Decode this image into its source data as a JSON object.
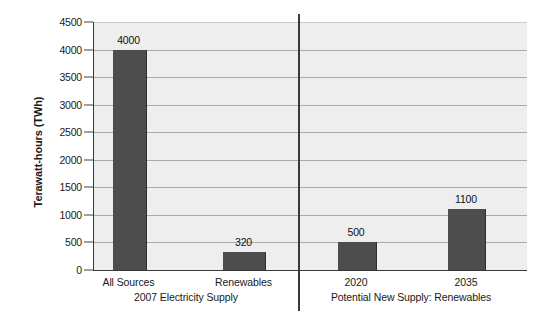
{
  "chart_data": {
    "type": "bar",
    "title": "",
    "xlabel": "",
    "ylabel": "Terawatt-hours (TWh)",
    "ylim": [
      0,
      4500
    ],
    "ytick_step": 500,
    "grid": true,
    "legend": "none",
    "categories": [
      "All Sources",
      "Renewables",
      "2020",
      "2035"
    ],
    "values": [
      4000,
      320,
      500,
      1100
    ],
    "value_labels": [
      "4000",
      "320",
      "500",
      "1100"
    ],
    "groups": [
      {
        "label": "2007 Electricity Supply",
        "categories": [
          "All Sources",
          "Renewables"
        ],
        "values": [
          4000,
          320
        ]
      },
      {
        "label": "Potential New Supply: Renewables",
        "categories": [
          "2020",
          "2035"
        ],
        "values": [
          500,
          1100
        ]
      }
    ],
    "yticks": [
      {
        "value": 4500,
        "label": "4500"
      },
      {
        "value": 4000,
        "label": "4000"
      },
      {
        "value": 3500,
        "label": "3500"
      },
      {
        "value": 3000,
        "label": "3000"
      },
      {
        "value": 2500,
        "label": "2500"
      },
      {
        "value": 2000,
        "label": "2000"
      },
      {
        "value": 1500,
        "label": "1500"
      },
      {
        "value": 1000,
        "label": "1000"
      },
      {
        "value": 500,
        "label": "500"
      },
      {
        "value": 0,
        "label": "0"
      }
    ],
    "colors": {
      "bar": "#4d4d4d",
      "bar_edge": "#2e2e2e",
      "plot_background": "#eeeeee",
      "gridline": "#aaaaaa",
      "axis": "#3a3a3a",
      "text": "#1a1a1a",
      "page_background": "#ffffff"
    }
  }
}
